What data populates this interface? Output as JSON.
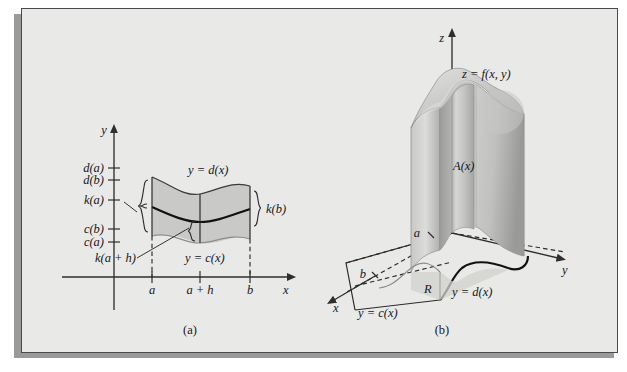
{
  "figure": {
    "panels": [
      {
        "id": "a",
        "caption": "(a)",
        "axis_x_label": "x",
        "axis_y_label": "y",
        "y_ticks": [
          "d(a)",
          "d(b)",
          "k(a)",
          "c(b)",
          "c(a)",
          "k(a + h)"
        ],
        "x_ticks": [
          "a",
          "a + h",
          "b"
        ],
        "curve_upper_label": "y = d(x)",
        "curve_lower_label": "y = c(x)",
        "brace_label_right": "k(b)"
      },
      {
        "id": "b",
        "caption": "(b)",
        "axis_x_label": "x",
        "axis_y_label": "y",
        "axis_z_label": "z",
        "surface_label": "z = f(x, y)",
        "cross_section_label": "A(x)",
        "region_label": "R",
        "boundary_lower_label": "y = c(x)",
        "boundary_upper_label": "y = d(x)",
        "x_tick_a": "a",
        "x_tick_b": "b"
      }
    ]
  },
  "colors": {
    "page_background": "#ffffff",
    "plate_background": "#e9e9e7",
    "plate_border": "#4a4a4a",
    "drop_shadow": "#9a9a9a",
    "region_shade": "#c9c9c7",
    "ink": "#171717",
    "solid_light": "#d8d8d6",
    "solid_mid": "#bcbcba",
    "solid_dark": "#9e9e9c"
  }
}
